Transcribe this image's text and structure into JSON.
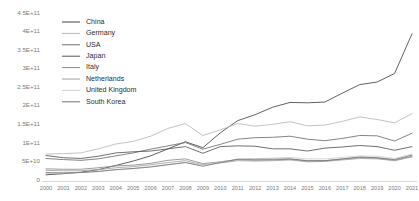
{
  "chart_data": {
    "type": "line",
    "title": "",
    "xlabel": "",
    "ylabel": "",
    "grid": false,
    "legend_position": "top-left",
    "ylim": [
      0,
      450000000000
    ],
    "ytick_labels": [
      "4.5E+11",
      "4E+11",
      "3.5E+11",
      "3E+11",
      "2.5E+11",
      "2E+11",
      "1.5E+11",
      "1E+11",
      "5E+10",
      "0"
    ],
    "ytick_values": [
      450000000000,
      400000000000,
      350000000000,
      300000000000,
      250000000000,
      200000000000,
      150000000000,
      100000000000,
      50000000000,
      0
    ],
    "categories": [
      "2000",
      "2001",
      "2002",
      "2003",
      "2004",
      "2005",
      "2006",
      "2007",
      "2008",
      "2009",
      "2010",
      "2011",
      "2012",
      "2013",
      "2014",
      "2015",
      "2016",
      "2017",
      "2018",
      "2019",
      "2020",
      "2021"
    ],
    "x": [
      2000,
      2001,
      2002,
      2003,
      2004,
      2005,
      2006,
      2007,
      2008,
      2009,
      2010,
      2011,
      2012,
      2013,
      2014,
      2015,
      2016,
      2017,
      2018,
      2019,
      2020,
      2021
    ],
    "series": [
      {
        "name": "China",
        "color": "#454545",
        "values": [
          14000000000,
          17000000000,
          21000000000,
          28000000000,
          39000000000,
          51000000000,
          65000000000,
          84000000000,
          103000000000,
          87000000000,
          127000000000,
          160000000000,
          176000000000,
          196000000000,
          209000000000,
          208000000000,
          210000000000,
          234000000000,
          257000000000,
          264000000000,
          287000000000,
          394000000000
        ]
      },
      {
        "name": "Germany",
        "color": "#b8b8b8",
        "values": [
          70000000000,
          71000000000,
          73000000000,
          84000000000,
          97000000000,
          104000000000,
          118000000000,
          139000000000,
          152000000000,
          120000000000,
          135000000000,
          152000000000,
          145000000000,
          150000000000,
          157000000000,
          146000000000,
          148000000000,
          158000000000,
          170000000000,
          163000000000,
          154000000000,
          179000000000
        ]
      },
      {
        "name": "USA",
        "color": "#6e6e6e",
        "values": [
          58000000000,
          55000000000,
          53000000000,
          57000000000,
          65000000000,
          73000000000,
          83000000000,
          92000000000,
          101000000000,
          83000000000,
          96000000000,
          110000000000,
          114000000000,
          115000000000,
          118000000000,
          110000000000,
          106000000000,
          112000000000,
          120000000000,
          119000000000,
          105000000000,
          126000000000
        ]
      },
      {
        "name": "Japan",
        "color": "#565656",
        "values": [
          66000000000,
          60000000000,
          58000000000,
          64000000000,
          73000000000,
          76000000000,
          78000000000,
          84000000000,
          90000000000,
          72000000000,
          90000000000,
          92000000000,
          91000000000,
          84000000000,
          84000000000,
          78000000000,
          86000000000,
          89000000000,
          93000000000,
          90000000000,
          80000000000,
          90000000000
        ]
      },
      {
        "name": "Italy",
        "color": "#8a8a8a",
        "values": [
          30000000000,
          29000000000,
          29000000000,
          33000000000,
          38000000000,
          40000000000,
          45000000000,
          53000000000,
          57000000000,
          44000000000,
          49000000000,
          55000000000,
          53000000000,
          54000000000,
          56000000000,
          51000000000,
          52000000000,
          56000000000,
          60000000000,
          59000000000,
          53000000000,
          64000000000
        ]
      },
      {
        "name": "Netherlands",
        "color": "#a0a0a0",
        "values": [
          26000000000,
          25000000000,
          25000000000,
          28000000000,
          33000000000,
          36000000000,
          41000000000,
          47000000000,
          52000000000,
          41000000000,
          46000000000,
          52000000000,
          51000000000,
          52000000000,
          54000000000,
          49000000000,
          50000000000,
          54000000000,
          58000000000,
          57000000000,
          52000000000,
          62000000000
        ]
      },
      {
        "name": "United Kingdom",
        "color": "#cfcfcf",
        "values": [
          18000000000,
          19000000000,
          20000000000,
          23000000000,
          27000000000,
          31000000000,
          36000000000,
          42000000000,
          47000000000,
          40000000000,
          48000000000,
          56000000000,
          57000000000,
          59000000000,
          61000000000,
          57000000000,
          57000000000,
          61000000000,
          65000000000,
          64000000000,
          58000000000,
          70000000000
        ]
      },
      {
        "name": "South Korea",
        "color": "#747474",
        "values": [
          20000000000,
          19000000000,
          20000000000,
          23000000000,
          28000000000,
          31000000000,
          35000000000,
          41000000000,
          47000000000,
          37000000000,
          47000000000,
          56000000000,
          56000000000,
          56000000000,
          57000000000,
          52000000000,
          52000000000,
          57000000000,
          62000000000,
          60000000000,
          55000000000,
          67000000000
        ]
      }
    ]
  },
  "legend": {
    "items": [
      {
        "label": "China"
      },
      {
        "label": "Germany"
      },
      {
        "label": "USA"
      },
      {
        "label": "Japan"
      },
      {
        "label": "Italy"
      },
      {
        "label": "Netherlands"
      },
      {
        "label": "United Kingdom"
      },
      {
        "label": "South Korea"
      }
    ]
  }
}
